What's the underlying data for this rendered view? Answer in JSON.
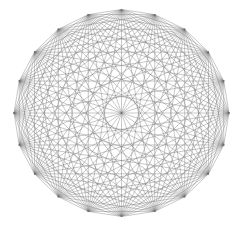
{
  "diagram": {
    "type": "complete-graph-mystic-rose",
    "vertex_count": 20,
    "center": {
      "x": 121.5,
      "y": 113
    },
    "radius": {
      "x": 107.5,
      "y": 103.5
    },
    "start_angle_deg": -90,
    "edge_color": "#6e6e6e",
    "edge_width": 0.45,
    "edge_opacity": 0.85,
    "background": "#ffffff"
  }
}
